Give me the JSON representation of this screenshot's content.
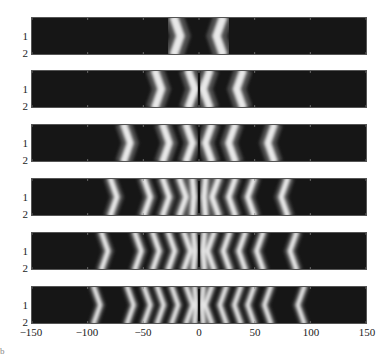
{
  "chart_data": {
    "type": "heatmap",
    "title": "",
    "xlabel": "",
    "ylabel": "",
    "xlim": [
      -150,
      150
    ],
    "ylim": [
      2,
      0
    ],
    "x_ticks": [
      -150,
      -100,
      -50,
      0,
      50,
      100,
      150
    ],
    "x_tick_labels": [
      "−150",
      "−100",
      "−50",
      "0",
      "50",
      "100",
      "150"
    ],
    "y_ticks": [
      1,
      2
    ],
    "y_tick_labels": [
      "1",
      "2"
    ],
    "colormap": "grayscale",
    "grid": false,
    "legend": null,
    "panels": [
      {
        "index": 1,
        "bright_bands_x": [
          -23,
          22
        ],
        "dark_center_line": false
      },
      {
        "index": 2,
        "bright_bands_x": [
          -40,
          -10,
          10,
          40
        ],
        "dark_center_line": true
      },
      {
        "index": 3,
        "bright_bands_x": [
          -68,
          -33,
          -12,
          12,
          33,
          68
        ],
        "dark_center_line": true
      },
      {
        "index": 4,
        "bright_bands_x": [
          -80,
          -50,
          -33,
          -18,
          -6,
          6,
          18,
          33,
          50,
          80
        ],
        "dark_center_line": true
      },
      {
        "index": 5,
        "bright_bands_x": [
          -88,
          -58,
          -42,
          -28,
          -14,
          -5,
          5,
          14,
          28,
          42,
          58,
          88
        ],
        "dark_center_line": true
      },
      {
        "index": 6,
        "bright_bands_x": [
          -95,
          -65,
          -50,
          -38,
          -25,
          -12,
          -4,
          4,
          12,
          25,
          38,
          50,
          65,
          95
        ],
        "dark_center_line": true
      }
    ]
  },
  "corner_mark": "b"
}
